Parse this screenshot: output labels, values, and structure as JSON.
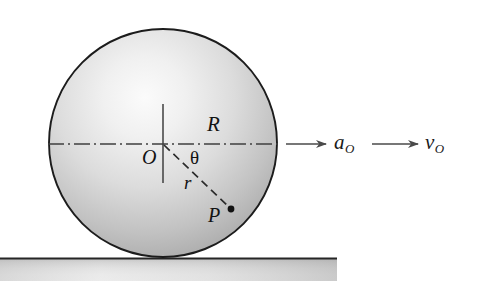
{
  "figure": {
    "background_color": "#ffffff"
  },
  "disk": {
    "name": "shaded-circle",
    "center": {
      "x": 163,
      "y": 143
    },
    "radius": 114,
    "outline_color": "#1c1c1c",
    "fill_light": "#f2f2f2",
    "fill_dark": "#9a9a9a"
  },
  "ground": {
    "name": "ground-surface",
    "x_start": 0,
    "x_end": 337,
    "line_y": 258,
    "band_bottom": 281,
    "line_color": "#2a2a2a",
    "band_light": "#ffffff",
    "band_dark": "#9d9d9d"
  },
  "axes": {
    "horizontal": {
      "label": "R",
      "style": "dash-dot",
      "y": 144,
      "x_start": 48,
      "x_end": 278,
      "color": "#3a3a3a"
    },
    "vertical": {
      "style": "solid",
      "x": 163,
      "y_start": 104,
      "y_end": 183,
      "color": "#3a3a3a"
    }
  },
  "radius_line": {
    "label": "r",
    "style": "dashed",
    "from": {
      "x": 163,
      "y": 144
    },
    "to": {
      "x": 231,
      "y": 209
    },
    "color": "#2b2b2b"
  },
  "angle": {
    "label": "θ",
    "vertex": {
      "x": 163,
      "y": 144
    },
    "between": [
      "horizontal-axis",
      "radius-line"
    ],
    "approx_degrees": 44
  },
  "points": [
    {
      "name": "center-point",
      "label": "O",
      "x": 163,
      "y": 144
    },
    {
      "name": "particle-point",
      "label": "P",
      "x": 231,
      "y": 209,
      "marker": "filled-dot"
    }
  ],
  "vectors": [
    {
      "name": "acceleration-vector",
      "symbol": "a",
      "subscript": "O",
      "arrow_start_x": 286,
      "arrow_end_x": 327,
      "arrow_y": 144,
      "color": "#4a4a4a"
    },
    {
      "name": "velocity-vector",
      "symbol": "v",
      "subscript": "O",
      "arrow_start_x": 372,
      "arrow_end_x": 419,
      "arrow_y": 144,
      "color": "#4a4a4a"
    }
  ]
}
